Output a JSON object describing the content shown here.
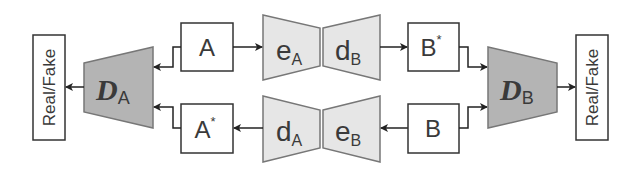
{
  "diagram": {
    "real_fake_left": {
      "label": "Real/Fake"
    },
    "real_fake_right": {
      "label": "Real/Fake"
    },
    "discriminator_a": {
      "main": "D",
      "sub": "A"
    },
    "discriminator_b": {
      "main": "D",
      "sub": "B"
    },
    "box_a": {
      "main": "A",
      "sup": ""
    },
    "box_a_star": {
      "main": "A",
      "sup": "*"
    },
    "box_b_star": {
      "main": "B",
      "sup": "*"
    },
    "box_b": {
      "main": "B",
      "sup": ""
    },
    "encoder_a": {
      "main": "e",
      "sub": "A"
    },
    "decoder_b": {
      "main": "d",
      "sub": "B"
    },
    "decoder_a": {
      "main": "d",
      "sub": "A"
    },
    "encoder_b": {
      "main": "e",
      "sub": "B"
    },
    "colors": {
      "discriminator_fill": "#b4b4b4",
      "coder_fill": "#e6e6e6",
      "stroke": "#3a3a3a",
      "shape_stroke": "#777777"
    }
  }
}
